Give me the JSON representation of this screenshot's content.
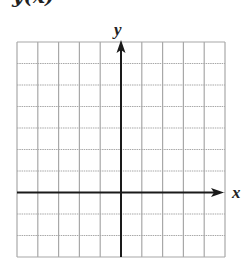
{
  "header": {
    "clipped_title": "y(x)"
  },
  "graph": {
    "x_axis_label": "x",
    "y_axis_label": "y",
    "grid": {
      "columns": 10,
      "rows": 10,
      "origin_column_index": 5,
      "origin_row_index": 7,
      "left": 17,
      "top": 42,
      "right": 225,
      "bottom": 257
    },
    "colors": {
      "grid_line": "#a8a8a8",
      "axis": "#1a1a1a",
      "background": "#ffffff"
    }
  }
}
